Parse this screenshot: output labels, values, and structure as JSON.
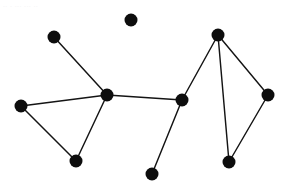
{
  "figure": {
    "width": 289,
    "height": 194,
    "background_color": "#ffffff",
    "node_color": "#0d0d0d",
    "edge_color": "#141414",
    "node_radius": 6.5,
    "edge_width": 1.45
  },
  "watermark": {
    "text": "..  . ... ... ..",
    "color": "#f2f2f3"
  },
  "chart_data": {
    "type": "scatter",
    "title": "",
    "subtitle": "",
    "xlabel": "",
    "ylabel": "",
    "grid": false,
    "legend": "none",
    "axis_visible": false,
    "xlim": [
      0,
      289
    ],
    "ylim": [
      0,
      194
    ],
    "graph_kind": "undirected",
    "node_count": 10,
    "edge_count": 10,
    "nodes": [
      {
        "id": "n0",
        "label": "isolated-top",
        "x": 131,
        "y": 20,
        "degree": 0
      },
      {
        "id": "n1",
        "label": "upper-left",
        "x": 54,
        "y": 37,
        "degree": 1
      },
      {
        "id": "n2",
        "label": "top-right",
        "x": 218,
        "y": 35,
        "degree": 3
      },
      {
        "id": "n3",
        "label": "left",
        "x": 21,
        "y": 106,
        "degree": 2
      },
      {
        "id": "n4",
        "label": "hub-left",
        "x": 107,
        "y": 95,
        "degree": 4
      },
      {
        "id": "n5",
        "label": "hub-right",
        "x": 182,
        "y": 100,
        "degree": 3
      },
      {
        "id": "n6",
        "label": "right",
        "x": 268,
        "y": 95,
        "degree": 2
      },
      {
        "id": "n7",
        "label": "bottom-left",
        "x": 76,
        "y": 161,
        "degree": 2
      },
      {
        "id": "n8",
        "label": "bottom-right",
        "x": 229,
        "y": 162,
        "degree": 2
      },
      {
        "id": "n9",
        "label": "pendant-bottom",
        "x": 152,
        "y": 174,
        "degree": 1
      }
    ],
    "edges": [
      {
        "source": "n1",
        "target": "n4"
      },
      {
        "source": "n3",
        "target": "n4"
      },
      {
        "source": "n3",
        "target": "n7"
      },
      {
        "source": "n7",
        "target": "n4"
      },
      {
        "source": "n4",
        "target": "n5"
      },
      {
        "source": "n5",
        "target": "n9"
      },
      {
        "source": "n5",
        "target": "n2"
      },
      {
        "source": "n2",
        "target": "n6"
      },
      {
        "source": "n2",
        "target": "n8"
      },
      {
        "source": "n6",
        "target": "n8"
      }
    ]
  }
}
